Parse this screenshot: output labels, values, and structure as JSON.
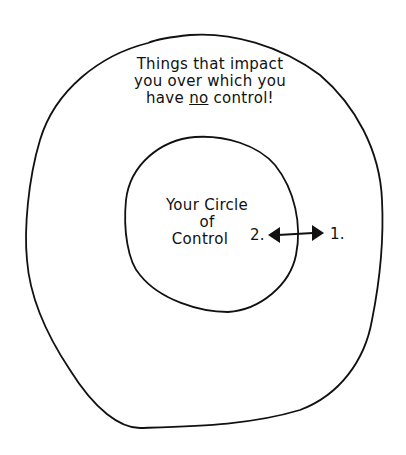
{
  "outer_label": {
    "line1": "Things that impact",
    "line2": "you over which you",
    "line3_pre": "have ",
    "line3_em": "no",
    "line3_post": " control!"
  },
  "inner_label": {
    "line1": "Your Circle",
    "line2": "of",
    "line3": "Control"
  },
  "arrow": {
    "left_label": "2.",
    "right_label": "1."
  },
  "colors": {
    "stroke": "#111111",
    "background": "#ffffff"
  }
}
